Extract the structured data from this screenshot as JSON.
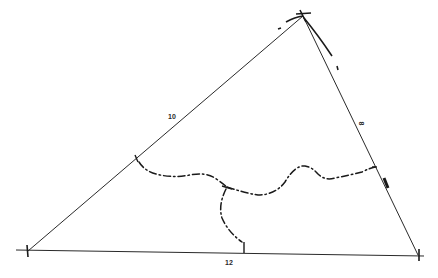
{
  "diagram": {
    "type": "triangle-with-bisector-curves",
    "vertices": {
      "top": {
        "x": 303,
        "y": 16
      },
      "bottom_left": {
        "x": 28,
        "y": 251
      },
      "bottom_right": {
        "x": 418,
        "y": 255
      }
    },
    "side_labels": {
      "left_side": "10",
      "right_side": "8",
      "bottom_side": "12"
    },
    "colors": {
      "line": "#2a2a2a",
      "background": "#ffffff"
    },
    "curve_style": "dash-dot"
  }
}
